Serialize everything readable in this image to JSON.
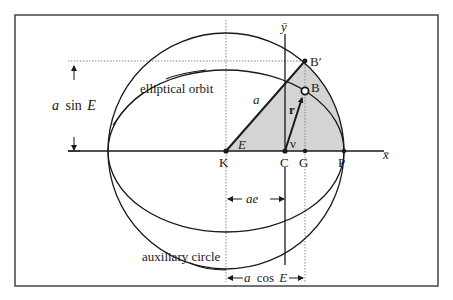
{
  "diagram": {
    "colors": {
      "frame": "#444444",
      "stroke": "#1a1a1a",
      "shade": "#d4d4d4",
      "dotted": "#888888",
      "background": "#ffffff"
    },
    "axes": {
      "x_label": "x̄",
      "y_label": "ȳ"
    },
    "points": {
      "K": "K",
      "C": "C",
      "G": "G",
      "P": "P",
      "B": "B",
      "B_prime": "B′"
    },
    "labels": {
      "elliptical_orbit": "elliptical orbit",
      "auxiliary_circle": "auxiliary circle",
      "a_sin_E_a": "a",
      "a_sin_E_sin": "sin",
      "a_sin_E_E": "E",
      "semi_major": "a",
      "angle_E": "E",
      "true_anomaly": "ν",
      "radius_vector": "r",
      "ae": "ae",
      "a_cos_E_a": "a",
      "a_cos_E_cos": "cos",
      "a_cos_E_E": "E"
    }
  }
}
